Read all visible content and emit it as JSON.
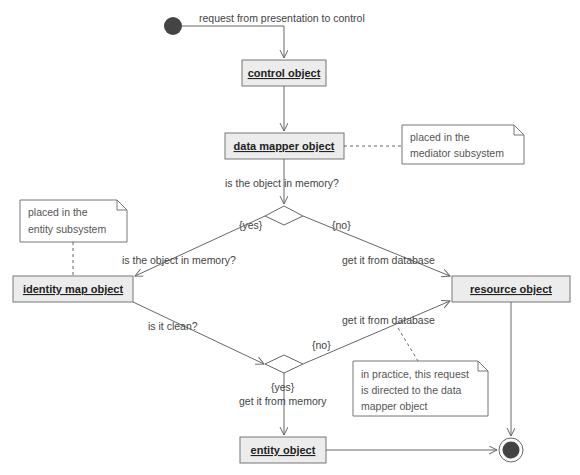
{
  "diagram": {
    "colors": {
      "line": "#666666",
      "box_fill": "#ececec",
      "box_stroke": "#777777",
      "node_fill": "#444444",
      "text": "#444444"
    },
    "start_label": "request from presentation to control",
    "objects": {
      "control": "control object",
      "data_mapper": "data mapper object",
      "identity_map": "identity map object",
      "resource": "resource object",
      "entity": "entity object"
    },
    "notes": {
      "mediator": [
        "placed in the",
        "mediator subsystem"
      ],
      "entity": [
        "placed in the",
        "entity subsystem"
      ],
      "practice": [
        "in practice, this request",
        "is directed to the data",
        "mapper object"
      ]
    },
    "labels": {
      "in_memory_question": "is the object in memory?",
      "yes1": "{yes}",
      "no1": "{no}",
      "in_memory_question2": "is the object in memory?",
      "get_from_db1": "get it from database",
      "is_clean": "is it clean?",
      "no2": "{no}",
      "get_from_db2": "get it from database",
      "yes2": "{yes}",
      "get_from_memory": "get it from memory"
    }
  }
}
